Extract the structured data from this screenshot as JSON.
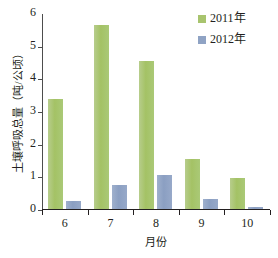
{
  "chart_data": {
    "type": "bar",
    "title": "",
    "xlabel": "月份",
    "ylabel": "土壤呼吸总量（吨/公顷）",
    "categories": [
      "6",
      "7",
      "8",
      "9",
      "10"
    ],
    "series": [
      {
        "name": "2011年",
        "color": "#a8c46e",
        "values": [
          3.4,
          5.65,
          4.55,
          1.53,
          0.95
        ]
      },
      {
        "name": "2012年",
        "color": "#8fa3c4",
        "values": [
          0.25,
          0.75,
          1.05,
          0.3,
          0.07
        ]
      }
    ],
    "ylim": [
      0,
      6
    ],
    "yticks": [
      "0",
      "1",
      "2",
      "3",
      "4",
      "5",
      "6"
    ],
    "grid": false,
    "legend_position": "top-right"
  }
}
